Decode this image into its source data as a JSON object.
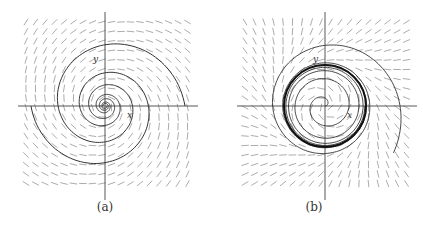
{
  "figure": {
    "panels": [
      {
        "id": "a",
        "caption": "(a)",
        "x_axis_label": "x",
        "y_axis_label": "y",
        "description": "Direction field with a single trajectory spiralling into a stable focus at the origin"
      },
      {
        "id": "b",
        "caption": "(b)",
        "x_axis_label": "x",
        "y_axis_label": "y",
        "description": "Direction field with trajectories converging to a stable limit cycle (bold circle) around an unstable focus"
      }
    ]
  },
  "colors": {
    "field": "#888888",
    "axis": "#444444",
    "trajectory": "#333333",
    "limit_cycle": "#111111"
  }
}
